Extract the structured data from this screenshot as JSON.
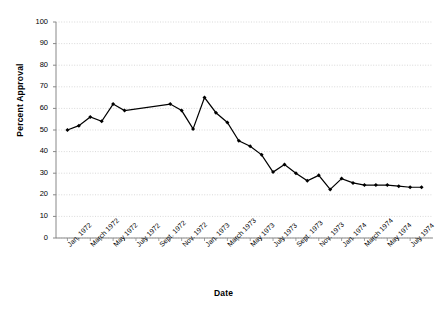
{
  "chart_data": {
    "type": "line",
    "title": "",
    "xlabel": "Date",
    "ylabel": "Percent Approval",
    "ylim": [
      0,
      100
    ],
    "ytick_values": [
      0,
      10,
      20,
      30,
      40,
      50,
      60,
      70,
      80,
      90,
      100
    ],
    "grid": true,
    "legend": "none",
    "marker": "filled-diamond",
    "line_color": "#000000",
    "grid_color": "#c8c8c8",
    "axis_color": "#808080",
    "categories": [
      "Jan. 1972",
      "Feb. 1972",
      "March 1972",
      "April 1972",
      "May 1972",
      "June 1972",
      "July 1972",
      "Aug. 1972",
      "Sept. 1972",
      "Oct. 1972",
      "Nov. 1972",
      "Dec. 1972",
      "Jan. 1973",
      "Feb. 1973",
      "March 1973",
      "April 1973",
      "May 1973",
      "June 1973",
      "July 1973",
      "Aug. 1973",
      "Sept. 1973",
      "Oct. 1973",
      "Nov. 1973",
      "Dec. 1973",
      "Jan. 1974",
      "Feb. 1974",
      "March 1974",
      "April 1974",
      "May 1974",
      "June 1974",
      "July 1974",
      "Aug. 1974"
    ],
    "xtick_labels": [
      "Jan. 1972",
      "March 1972",
      "May 1972",
      "July 1972",
      "Sept. 1972",
      "Nov. 1972",
      "Jan. 1973",
      "March 1973",
      "May 1973",
      "July 1973",
      "Sept. 1973",
      "Nov. 1973",
      "Jan. 1974",
      "March 1974",
      "May 1974",
      "July 1974"
    ],
    "series": [
      {
        "name": "Percent Approval",
        "values": [
          50,
          52,
          56,
          54,
          62,
          59,
          null,
          null,
          null,
          62,
          59,
          50.5,
          65,
          58,
          53.5,
          45,
          42.5,
          38.5,
          30.5,
          34,
          30,
          26.5,
          29,
          22.5,
          27.5,
          25.5,
          24.5,
          24.5,
          24.5,
          24,
          23.5,
          23.5
        ]
      }
    ],
    "points": [
      {
        "x": 0,
        "label": "Jan. 1972",
        "y": 50
      },
      {
        "x": 1,
        "label": "Feb. 1972",
        "y": 52
      },
      {
        "x": 2,
        "label": "March 1972",
        "y": 56
      },
      {
        "x": 3,
        "label": "April 1972",
        "y": 54
      },
      {
        "x": 4,
        "label": "May 1972",
        "y": 62
      },
      {
        "x": 5,
        "label": "June 1972",
        "y": 59
      },
      {
        "x": 9,
        "label": "Oct. 1972",
        "y": 62
      },
      {
        "x": 10,
        "label": "Nov. 1972",
        "y": 59
      },
      {
        "x": 11,
        "label": "Dec. 1972",
        "y": 50.5
      },
      {
        "x": 12,
        "label": "Jan. 1973",
        "y": 65
      },
      {
        "x": 13,
        "label": "Feb. 1973",
        "y": 58
      },
      {
        "x": 14,
        "label": "March 1973",
        "y": 53.5
      },
      {
        "x": 15,
        "label": "April 1973",
        "y": 45
      },
      {
        "x": 16,
        "label": "May 1973",
        "y": 42.5
      },
      {
        "x": 17,
        "label": "June 1973",
        "y": 38.5
      },
      {
        "x": 18,
        "label": "July 1973",
        "y": 30.5
      },
      {
        "x": 19,
        "label": "Aug. 1973",
        "y": 34
      },
      {
        "x": 20,
        "label": "Sept. 1973",
        "y": 30
      },
      {
        "x": 21,
        "label": "Oct. 1973",
        "y": 26.5
      },
      {
        "x": 22,
        "label": "Nov. 1973",
        "y": 29
      },
      {
        "x": 23,
        "label": "Dec. 1973",
        "y": 22.5
      },
      {
        "x": 24,
        "label": "Jan. 1974",
        "y": 27.5
      },
      {
        "x": 25,
        "label": "Feb. 1974",
        "y": 25.5
      },
      {
        "x": 26,
        "label": "March 1974",
        "y": 24.5
      },
      {
        "x": 27,
        "label": "April 1974",
        "y": 24.5
      },
      {
        "x": 28,
        "label": "May 1974",
        "y": 24.5
      },
      {
        "x": 29,
        "label": "June 1974",
        "y": 24
      },
      {
        "x": 30,
        "label": "July 1974",
        "y": 23.5
      },
      {
        "x": 31,
        "label": "Aug. 1974",
        "y": 23.5
      }
    ]
  },
  "axes": {
    "y_title": "Percent Approval",
    "x_title": "Date"
  }
}
